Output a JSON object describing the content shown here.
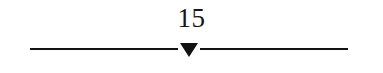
{
  "figure": {
    "name": "axis-marker-figure",
    "background_color": "#ffffff",
    "ink_color": "#131313",
    "marker": {
      "label": "15",
      "glyph": "triangle-down",
      "fill_color": "#111111"
    },
    "axis": {
      "left_segment_label": "",
      "right_segment_label": ""
    }
  },
  "chart_data": {
    "type": "scatter",
    "title": "",
    "xlabel": "",
    "ylabel": "",
    "categories": [
      "15"
    ],
    "values": [
      15
    ],
    "annotations": [
      "15"
    ],
    "legend": [],
    "grid": false
  }
}
